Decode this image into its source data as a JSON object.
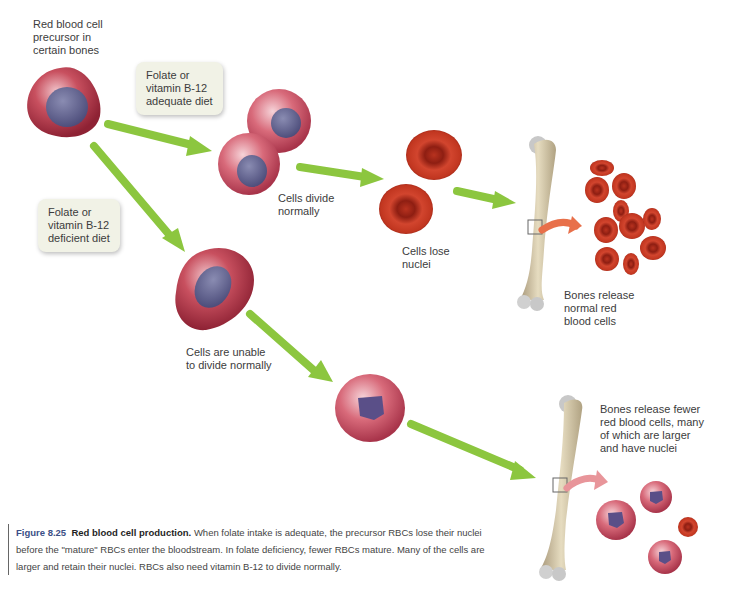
{
  "figure": {
    "number": "Figure 8.25",
    "title": "Red blood cell production.",
    "caption": "When folate intake is adequate, the precursor RBCs lose their nuclei before the \"mature\" RBCs enter the bloodstream. In folate deficiency, fewer RBCs mature. Many of the cells are larger and retain their nuclei. RBCs also need vitamin B-12 to divide normally."
  },
  "labels": {
    "precursor": "Red blood cell\nprecursor in\ncertain bones",
    "adequate_diet": "Folate or\nvitamin B-12\nadequate diet",
    "deficient_diet": "Folate or\nvitamin B-12\ndeficient diet",
    "cells_divide": "Cells divide\nnormally",
    "cells_lose_nuclei": "Cells lose\nnuclei",
    "bones_release_normal": "Bones release\nnormal red\nblood cells",
    "cells_unable": "Cells are unable\nto divide normally",
    "bones_release_fewer": "Bones release fewer\nred blood cells, many\nof which are larger\nand have nuclei"
  },
  "colors": {
    "arrow_green": "#8cc63f",
    "arrow_orange": "#e8704a",
    "arrow_pink": "#e8959a",
    "cell_membrane": "#b5394a",
    "nucleus": "#5a5a86",
    "mature_rbc": "#c8321f",
    "bone": "#d8ccaa",
    "callout_bg": "#f1f2e6",
    "figure_number": "#3b4f86"
  }
}
